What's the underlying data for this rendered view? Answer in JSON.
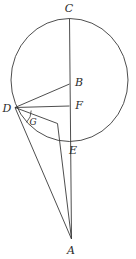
{
  "figure": {
    "kind": "geometry-diagram",
    "title": "",
    "stroke_color": "#3a3a3a",
    "label_color": "#2b2b2b",
    "background": "#ffffff",
    "width": 136,
    "height": 259,
    "circle": {
      "cx": 69.5,
      "cy": 80,
      "rx": 58.5,
      "ry": 61.5
    },
    "points": [
      {
        "id": "C",
        "label": "C",
        "x": 69.5,
        "y": 18.5,
        "label_x": 69,
        "label_y": 8,
        "size": "normal"
      },
      {
        "id": "B",
        "label": "B",
        "x": 69.5,
        "y": 84,
        "label_x": 79,
        "label_y": 82,
        "size": "normal"
      },
      {
        "id": "D",
        "label": "D",
        "x": 15,
        "y": 107.5,
        "label_x": 7,
        "label_y": 108,
        "size": "normal"
      },
      {
        "id": "F",
        "label": "F",
        "x": 69.5,
        "y": 106,
        "label_x": 79,
        "label_y": 105,
        "size": "normal"
      },
      {
        "id": "G",
        "label": "G",
        "x": 36,
        "y": 119,
        "label_x": 33,
        "label_y": 122,
        "size": "small"
      },
      {
        "id": "E",
        "label": "E",
        "x": 69.5,
        "y": 141.5,
        "label_x": 72,
        "label_y": 150,
        "size": "normal"
      },
      {
        "id": "A",
        "label": "A",
        "x": 71.5,
        "y": 239,
        "label_x": 71,
        "label_y": 250,
        "size": "normal"
      }
    ],
    "segments": [
      {
        "id": "CE",
        "from": "C",
        "to": "A",
        "note": "vertical diameter extended to A"
      },
      {
        "id": "DB",
        "from": "D",
        "to": "B"
      },
      {
        "id": "DF",
        "from": "D",
        "to": "F"
      },
      {
        "id": "DA",
        "from": "D",
        "to": "A"
      },
      {
        "id": "DH",
        "from": "D",
        "to": "H"
      },
      {
        "id": "HA",
        "from": "H",
        "to": "A"
      }
    ],
    "angle_arc": {
      "cx": 15,
      "cy": 107.5,
      "r": 16,
      "at": "G"
    }
  }
}
